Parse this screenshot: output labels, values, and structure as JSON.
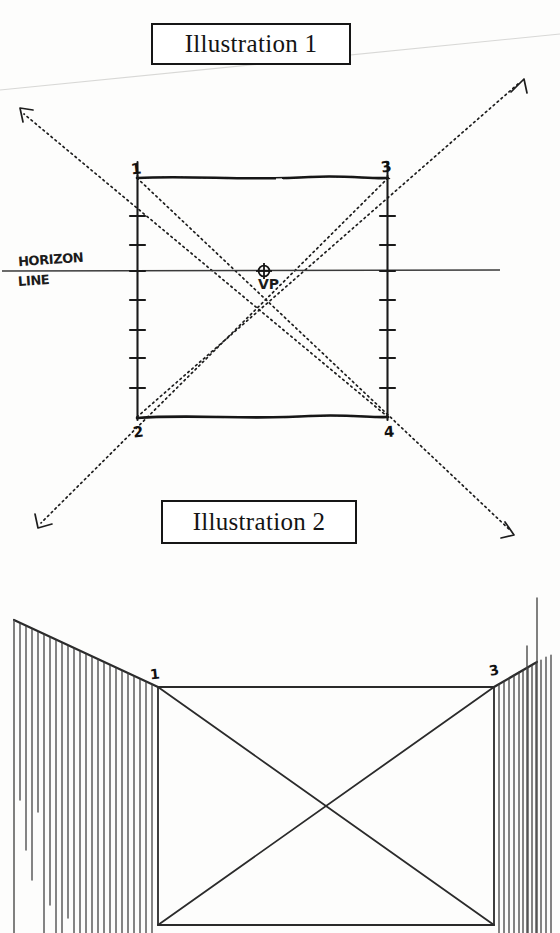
{
  "page": {
    "background_color": "#fdfdfc",
    "ink_color": "#1b1b1b",
    "width": 560,
    "height": 933
  },
  "captions": {
    "illustration_1": "Illustration 1",
    "illustration_2": "Illustration 2"
  },
  "labels": {
    "horizon_line_word_1": "HORIZON",
    "horizon_line_word_2": "LINE",
    "vanishing_point": "VP"
  },
  "illustration_1": {
    "corner_numbers": {
      "top_left": "1",
      "top_right": "3",
      "bottom_left": "2",
      "bottom_right": "4"
    },
    "rectangle": {
      "left_x": 137,
      "right_x": 388,
      "top_y": 178,
      "bottom_y": 417
    },
    "horizon_line": {
      "y": 271,
      "x_start": 2,
      "x_end": 500
    },
    "vanishing_point": {
      "x": 264,
      "y": 271
    },
    "left_edge_ticks": [
      216,
      245,
      271,
      300,
      330,
      358,
      388
    ],
    "right_edge_ticks": [
      216,
      245,
      271,
      300,
      330,
      358,
      388
    ],
    "diagonals": [
      {
        "from": "top-left-corner",
        "to": "bottom-right-arrow",
        "style": "dotted"
      },
      {
        "from": "top-right-corner",
        "to": "bottom-left-arrow",
        "style": "dotted"
      },
      {
        "from": "bottom-left-corner",
        "to": "top-right-arrow",
        "style": "dotted"
      },
      {
        "from": "bottom-right-corner",
        "to": "top-left-arrow",
        "style": "dotted"
      }
    ],
    "arrow_endpoints": [
      {
        "x": 20,
        "y": 110,
        "label": "upper-left"
      },
      {
        "x": 522,
        "y": 80,
        "label": "upper-right"
      },
      {
        "x": 38,
        "y": 527,
        "label": "lower-left"
      },
      {
        "x": 514,
        "y": 535,
        "label": "lower-right"
      }
    ]
  },
  "illustration_2": {
    "corner_numbers": {
      "top_left": "1",
      "top_right": "3"
    },
    "rectangle": {
      "left_x": 158,
      "right_x": 494,
      "top_y": 686,
      "bottom_y": 925
    },
    "hatching": {
      "left_line_count": 23,
      "right_line_count": 12,
      "orientation": "vertical",
      "description": "vertical hatch strokes hanging beneath the receding edges"
    },
    "diagonals": [
      {
        "from": "top-left-corner",
        "to": "bottom-right-corner",
        "style": "solid"
      },
      {
        "from": "top-right-corner",
        "to": "bottom-left-corner",
        "style": "solid"
      }
    ]
  },
  "scan_artifact": {
    "present": true,
    "description": "faint diagonal scanner streak across upper page"
  }
}
